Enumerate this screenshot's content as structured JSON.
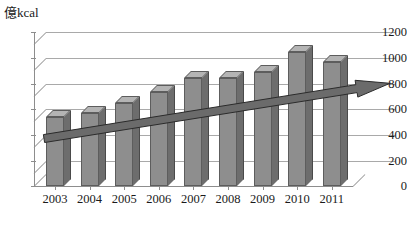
{
  "chart_data": {
    "type": "bar",
    "title": "",
    "subtitle": "",
    "unit_label": "億kcal",
    "xlabel": "",
    "ylabel": "億kcal",
    "categories": [
      "2003",
      "2004",
      "2005",
      "2006",
      "2007",
      "2008",
      "2009",
      "2010",
      "2011"
    ],
    "values": [
      540,
      570,
      650,
      730,
      845,
      845,
      890,
      1045,
      965
    ],
    "ylim": [
      0,
      1200
    ],
    "ytick_labels": [
      "0",
      "200",
      "400",
      "600",
      "800",
      "1000",
      "1200"
    ],
    "ytick_values": [
      0,
      200,
      400,
      600,
      800,
      1000,
      1200
    ],
    "grid": true,
    "grid_axis": "y",
    "legend": "none",
    "three_d": true,
    "bar_color": "#8e8e8e",
    "bar_top_color": "#b4b4b4",
    "bar_side_color": "#6d6d6d",
    "grid_color": "#a9a9a9",
    "axis_color": "#8d8d8d",
    "text_color": "#1a1a1a",
    "background": "#ffffff",
    "series": [
      {
        "name": "annual value",
        "values": [
          540,
          570,
          650,
          730,
          845,
          845,
          890,
          1045,
          965
        ]
      },
      {
        "name": "trend arrow",
        "type": "arrow",
        "start_value": 370,
        "end_value": 800,
        "start_category": "2003",
        "end_category": "2011",
        "color": "#6b6b6b"
      }
    ],
    "annotations": [
      {
        "kind": "arrow",
        "description": "upward trend arrow overlaying bars, pointing right",
        "from": 370,
        "to": 800
      }
    ]
  },
  "caption": {
    "text": ""
  }
}
